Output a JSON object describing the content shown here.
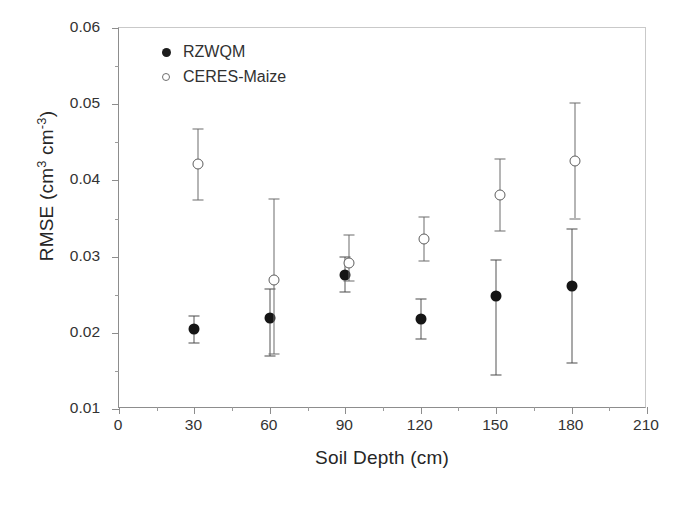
{
  "chart_data": {
    "type": "scatter",
    "title": "",
    "xlabel": "Soil Depth (cm)",
    "ylabel": "RMSE (cm3 cm-3)",
    "ylabel_parts": {
      "base": "RMSE (cm",
      "sup1": "3",
      "mid": " cm",
      "sup2": "-3",
      "tail": ")"
    },
    "xlim": [
      0,
      210
    ],
    "ylim": [
      0.01,
      0.06
    ],
    "xticks": [
      0,
      30,
      60,
      90,
      120,
      150,
      180,
      210
    ],
    "xtick_labels": [
      "0",
      "30",
      "60",
      "90",
      "120",
      "150",
      "180",
      "210"
    ],
    "xminor_interval": 15,
    "yticks": [
      0.01,
      0.02,
      0.03,
      0.04,
      0.05,
      0.06
    ],
    "ytick_labels": [
      "0.01",
      "0.02",
      "0.03",
      "0.04",
      "0.05",
      "0.06"
    ],
    "yminor_interval": 0.005,
    "grid": false,
    "legend_position": "top-left",
    "x": [
      30,
      60,
      90,
      120,
      150,
      180
    ],
    "series": [
      {
        "name": "RZWQM",
        "marker": "filled-circle",
        "color": "#151515",
        "values": [
          0.0205,
          0.022,
          0.0276,
          0.0218,
          0.0248,
          0.0262
        ],
        "err_low": [
          0.0187,
          0.017,
          0.0254,
          0.0192,
          0.0144,
          0.016
        ],
        "err_high": [
          0.0222,
          0.0258,
          0.03,
          0.0244,
          0.0296,
          0.0336
        ],
        "x_offset": 0
      },
      {
        "name": "CERES-Maize",
        "marker": "open-circle",
        "color": "#5d5d5d",
        "values": [
          0.0421,
          0.0269,
          0.0292,
          0.0323,
          0.0381,
          0.0426
        ],
        "err_low": [
          0.0374,
          0.0172,
          0.0268,
          0.0294,
          0.0334,
          0.035
        ],
        "err_high": [
          0.0467,
          0.0375,
          0.0328,
          0.0352,
          0.0428,
          0.0501
        ],
        "x_offset": 1.5
      }
    ]
  },
  "legend": {
    "items": [
      {
        "label": "RZWQM",
        "marker": "filled-circle"
      },
      {
        "label": "CERES-Maize",
        "marker": "open-circle"
      }
    ]
  },
  "colors": {
    "axis": "#8d8d8d",
    "text": "#2a2a2a",
    "series_filled": "#151515",
    "series_open": "#5d5d5d",
    "background": "#ffffff"
  }
}
